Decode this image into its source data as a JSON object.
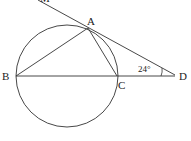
{
  "diagram": {
    "type": "geometry",
    "points": {
      "A": {
        "label": "A",
        "x": 88,
        "y": 28
      },
      "B": {
        "label": "B",
        "x": 16,
        "y": 76
      },
      "C": {
        "label": "C",
        "x": 117,
        "y": 76
      },
      "D": {
        "label": "D",
        "x": 175,
        "y": 75
      },
      "M": {
        "label": "M",
        "x": 38,
        "y": 0
      }
    },
    "circle": {
      "cx": 67,
      "cy": 76,
      "r": 51
    },
    "angle_label": "24°",
    "stroke_color": "#333333"
  }
}
